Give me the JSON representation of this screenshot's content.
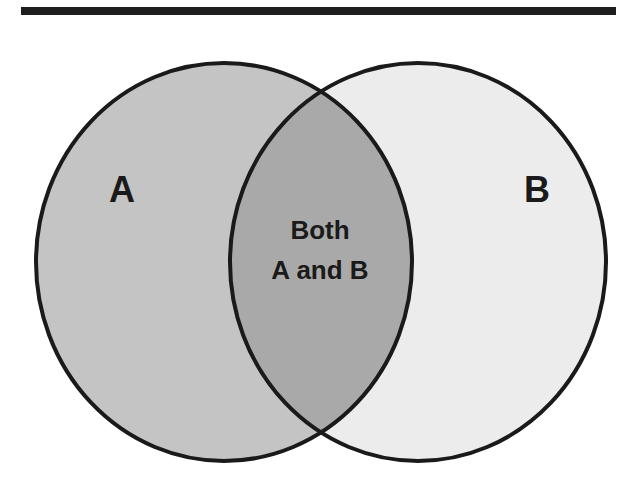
{
  "diagram": {
    "type": "venn",
    "sets": [
      {
        "id": "A",
        "label": "A",
        "fill": "#c4c4c4"
      },
      {
        "id": "B",
        "label": "B",
        "fill": "#ececec"
      }
    ],
    "intersection": {
      "label_line1": "Both",
      "label_line2": "A and B",
      "fill": "#a9a9a9"
    },
    "colors": {
      "outline": "#1a1a1a",
      "top_rule": "#1e1e1e",
      "background": "#ffffff"
    }
  }
}
